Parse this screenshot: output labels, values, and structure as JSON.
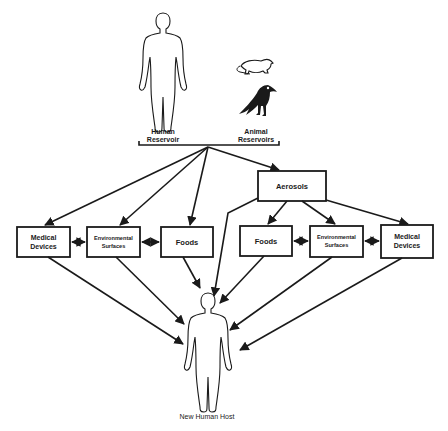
{
  "diagram": {
    "reservoirs": {
      "human_label_line1": "Human",
      "human_label_line2": "Reservoir",
      "animal_label_line1": "Animal",
      "animal_label_line2": "Reservoirs",
      "icons": [
        "human-figure-icon",
        "rodent-icon",
        "bird-icon"
      ]
    },
    "aerosols": {
      "label": "Aerosols"
    },
    "left_boxes": [
      {
        "line1": "Medical",
        "line2": "Devices"
      },
      {
        "line1": "Environmental",
        "line2": "Surfaces"
      },
      {
        "line1": "Foods",
        "line2": ""
      }
    ],
    "right_boxes": [
      {
        "line1": "Foods",
        "line2": ""
      },
      {
        "line1": "Environmental",
        "line2": "Surfaces"
      },
      {
        "line1": "Medical",
        "line2": "Devices"
      }
    ],
    "host": {
      "label": "New Human Host"
    },
    "colors": {
      "ink": "#1a1a1a",
      "background": "#ffffff"
    }
  }
}
